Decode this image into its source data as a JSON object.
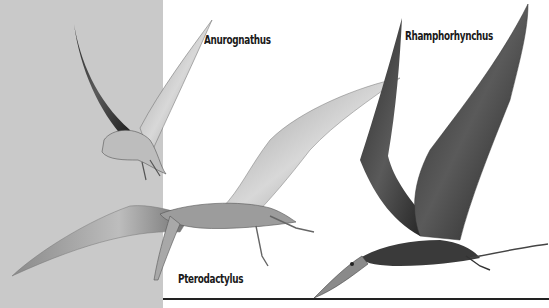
{
  "illustration": {
    "subject": "pterosaurs in flight",
    "background": {
      "panel_color": "#c9c9c9",
      "page_color": "#ffffff"
    },
    "labels": [
      {
        "id": "anurognathus",
        "text": "Anurognathus"
      },
      {
        "id": "rhamphorhynchus",
        "text": "Rhamphorhynchus"
      },
      {
        "id": "pterodactylus",
        "text": "Pterodactylus"
      }
    ]
  }
}
